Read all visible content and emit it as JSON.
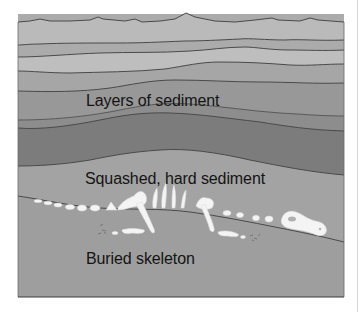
{
  "diagram": {
    "labels": {
      "layers": "Layers of sediment",
      "squashed": "Squashed, hard sediment",
      "skeleton": "Buried skeleton"
    },
    "layers": [
      {
        "name": "layer-1",
        "color": "#b9b9b9"
      },
      {
        "name": "layer-2",
        "color": "#a9a9a9"
      },
      {
        "name": "layer-3",
        "color": "#bdbdbd"
      },
      {
        "name": "layer-4",
        "color": "#a4a4a4"
      },
      {
        "name": "layer-5",
        "color": "#979797"
      },
      {
        "name": "layer-6",
        "color": "#8c8c8c"
      },
      {
        "name": "layer-7",
        "color": "#7a7a7a"
      },
      {
        "name": "layer-8-hard-sediment",
        "color": "#a2a2a2"
      },
      {
        "name": "layer-9-skeleton-bed",
        "color": "#9e9e9e"
      }
    ],
    "colors": {
      "outline": "#4a4a4a",
      "bone": "#f4f4f4",
      "text": "#141414",
      "background": "#ffffff"
    }
  }
}
